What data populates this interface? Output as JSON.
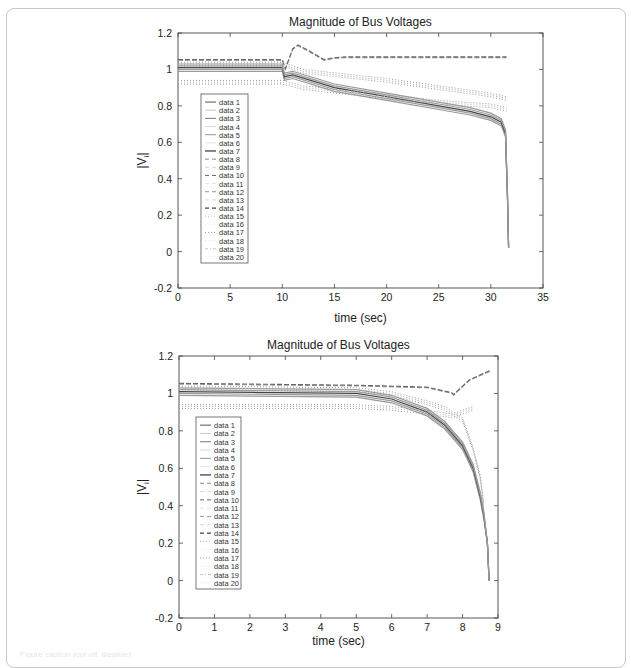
{
  "chart_data": [
    {
      "type": "line",
      "title": "Magnitude of Bus Voltages",
      "xlabel": "time (sec)",
      "ylabel": "|V_i|",
      "xlim": [
        0,
        35
      ],
      "ylim": [
        -0.2,
        1.2
      ],
      "xticks": [
        0,
        5,
        10,
        15,
        20,
        25,
        30,
        35
      ],
      "yticks": [
        -0.2,
        0,
        0.2,
        0.4,
        0.6,
        0.8,
        1,
        1.2
      ],
      "grid": false,
      "legend_position": "inside-left",
      "legend": [
        "data 1",
        "data 2",
        "data 3",
        "data 4",
        "data 5",
        "data 6",
        "data 7",
        "data 8",
        "data 9",
        "data 10",
        "data 11",
        "data 12",
        "data 13",
        "data 14",
        "data 15",
        "data 16",
        "data 17",
        "data 18",
        "data 19",
        "data 20"
      ],
      "series": [
        {
          "name": "high bus (recovers)",
          "x": [
            0,
            10,
            10.3,
            11,
            11.5,
            12.5,
            14,
            15,
            16,
            20,
            25,
            30,
            31.5
          ],
          "values": [
            1.05,
            1.05,
            1.0,
            1.11,
            1.13,
            1.1,
            1.05,
            1.06,
            1.065,
            1.065,
            1.065,
            1.065,
            1.065
          ]
        },
        {
          "name": "main cluster (collapse)",
          "x": [
            0,
            10,
            10.2,
            11,
            15,
            20,
            25,
            28,
            30,
            31,
            31.4,
            31.6,
            31.7
          ],
          "values": [
            1.01,
            1.01,
            0.96,
            0.97,
            0.9,
            0.85,
            0.8,
            0.77,
            0.74,
            0.71,
            0.65,
            0.3,
            0.02
          ]
        },
        {
          "name": "upper dotted",
          "x": [
            0,
            10,
            12,
            20,
            25,
            30,
            31.5
          ],
          "values": [
            1.03,
            1.03,
            0.99,
            0.94,
            0.9,
            0.86,
            0.84
          ]
        },
        {
          "name": "lower dotted",
          "x": [
            0,
            10,
            12,
            20,
            25,
            30,
            31.5
          ],
          "values": [
            0.93,
            0.93,
            0.9,
            0.85,
            0.82,
            0.8,
            0.78
          ]
        }
      ]
    },
    {
      "type": "line",
      "title": "Magnitude of Bus Voltages",
      "xlabel": "time (sec)",
      "ylabel": "|V_i|",
      "xlim": [
        0,
        9
      ],
      "ylim": [
        -0.2,
        1.2
      ],
      "xticks": [
        0,
        1,
        2,
        3,
        4,
        5,
        6,
        7,
        8,
        9
      ],
      "yticks": [
        -0.2,
        0,
        0.2,
        0.4,
        0.6,
        0.8,
        1,
        1.2
      ],
      "grid": false,
      "legend_position": "inside-left",
      "legend": [
        "data 1",
        "data 2",
        "data 3",
        "data 4",
        "data 5",
        "data 6",
        "data 7",
        "data 8",
        "data 9",
        "data 10",
        "data 11",
        "data 12",
        "data 13",
        "data 14",
        "data 15",
        "data 16",
        "data 17",
        "data 18",
        "data 19",
        "data 20"
      ],
      "series": [
        {
          "name": "high dashed",
          "x": [
            0,
            5,
            7,
            7.7,
            7.75,
            7.8,
            8.2,
            8.8
          ],
          "values": [
            1.05,
            1.04,
            1.03,
            1.0,
            0.99,
            1.0,
            1.07,
            1.12
          ]
        },
        {
          "name": "main cluster (collapse)",
          "x": [
            0,
            5,
            6,
            7,
            7.5,
            8,
            8.3,
            8.5,
            8.6,
            8.7,
            8.75
          ],
          "values": [
            1.01,
            1.0,
            0.97,
            0.9,
            0.83,
            0.72,
            0.6,
            0.45,
            0.35,
            0.2,
            0.0
          ]
        },
        {
          "name": "upper solid",
          "x": [
            0,
            5,
            6,
            7,
            7.5,
            8,
            8.3,
            8.5,
            8.6
          ],
          "values": [
            1.03,
            1.02,
            1.0,
            0.95,
            0.92,
            0.86,
            0.7,
            0.55,
            0.4
          ]
        },
        {
          "name": "lower dotted",
          "x": [
            0,
            5,
            6,
            7,
            7.7,
            8.3
          ],
          "values": [
            0.93,
            0.93,
            0.92,
            0.9,
            0.88,
            0.92
          ]
        }
      ]
    }
  ],
  "caption_text": "Figure caption (cut off, illegible)"
}
